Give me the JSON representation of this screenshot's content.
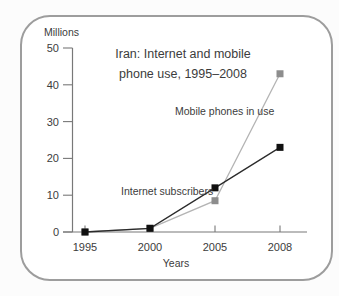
{
  "page": {
    "background": "#fcfcfc"
  },
  "card": {
    "border_color": "#9d9d9d",
    "background": "#ffffff"
  },
  "header": {
    "title_lines": [
      "Iran: Internet and mobile",
      "phone use, 1995–2008"
    ]
  },
  "chart_data": {
    "type": "line",
    "title": "Iran: Internet and mobile phone use, 1995–2008",
    "xlabel": "Years",
    "ylabel": "Millions",
    "categories": [
      "1995",
      "2000",
      "2005",
      "2008"
    ],
    "series": [
      {
        "name": "Mobile phones in use",
        "values": [
          0,
          1,
          8.5,
          43
        ],
        "line_color": "#b4b4b4",
        "marker_color": "#8d8d8d",
        "marker": "square"
      },
      {
        "name": "Internet subscribers",
        "values": [
          0,
          1,
          12,
          23
        ],
        "line_color": "#2b2b2b",
        "marker_color": "#101010",
        "marker": "square"
      }
    ],
    "ylim": [
      0,
      50
    ],
    "y_ticks": [
      0,
      10,
      20,
      30,
      40,
      50
    ],
    "grid": false,
    "legend": "inline-annotations",
    "axis_color": "#787878",
    "tick_label_color": "#3c3c3c"
  }
}
